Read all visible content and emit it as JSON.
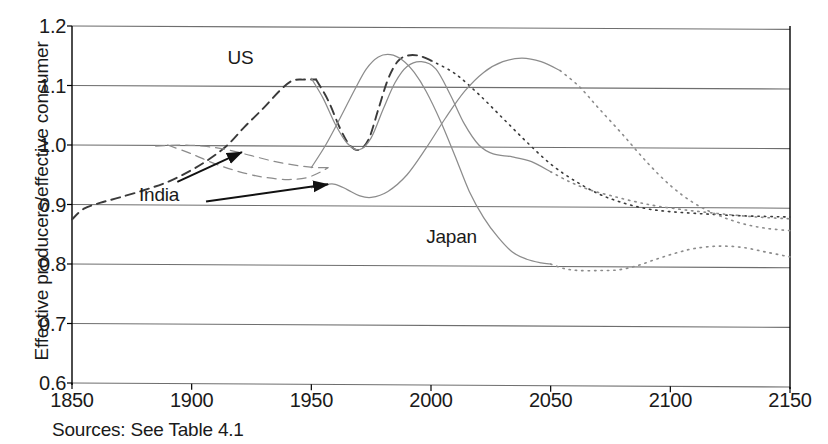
{
  "figure": {
    "source_note": "Sources:  See Table 4.1"
  },
  "chart_data": {
    "type": "line",
    "title": "",
    "xlabel": "",
    "ylabel": "Effective producers/effective consumer",
    "xlim": [
      1850,
      2150
    ],
    "ylim": [
      0.6,
      1.2
    ],
    "xticks": [
      1850,
      1900,
      1950,
      2000,
      2050,
      2100,
      2150
    ],
    "yticks": [
      "0.6",
      "0.7",
      "0.8",
      "0.9",
      "1.0",
      "1.1",
      "1.2"
    ],
    "grid": "horizontal",
    "legend": "inline-annotations",
    "annotations": [
      {
        "text": "US",
        "x": 1915,
        "y": 1.145
      },
      {
        "text": "India",
        "x": 1878,
        "y": 0.915
      },
      {
        "text": "Japan",
        "x": 1998,
        "y": 0.843
      }
    ],
    "arrows": [
      {
        "from": [
          1894,
          0.938
        ],
        "to": [
          1921,
          0.988
        ],
        "label": "India"
      },
      {
        "from": [
          1906,
          0.905
        ],
        "to": [
          1957,
          0.934
        ],
        "label": "India"
      }
    ],
    "series": [
      {
        "name": "US",
        "style": "dark",
        "segments": [
          {
            "style": "dashed",
            "kind": "historical",
            "points": [
              [
                1850,
                0.875
              ],
              [
                1855,
                0.893
              ],
              [
                1862,
                0.903
              ],
              [
                1870,
                0.912
              ],
              [
                1880,
                0.924
              ],
              [
                1890,
                0.938
              ],
              [
                1900,
                0.958
              ],
              [
                1908,
                0.978
              ],
              [
                1915,
                1.0
              ],
              [
                1922,
                1.03
              ],
              [
                1930,
                1.062
              ],
              [
                1937,
                1.092
              ],
              [
                1942,
                1.108
              ],
              [
                1947,
                1.11
              ],
              [
                1952,
                1.11
              ]
            ]
          },
          {
            "style": "dashed",
            "kind": "historical",
            "points": [
              [
                1952,
                1.11
              ],
              [
                1957,
                1.075
              ],
              [
                1962,
                1.028
              ],
              [
                1966,
                1.0
              ],
              [
                1970,
                0.992
              ],
              [
                1974,
                1.01
              ],
              [
                1978,
                1.06
              ],
              [
                1982,
                1.11
              ],
              [
                1986,
                1.14
              ],
              [
                1990,
                1.15
              ],
              [
                1995,
                1.15
              ],
              [
                2000,
                1.142
              ]
            ]
          },
          {
            "style": "dotted",
            "kind": "projection",
            "points": [
              [
                2000,
                1.142
              ],
              [
                2010,
                1.12
              ],
              [
                2020,
                1.085
              ],
              [
                2030,
                1.045
              ],
              [
                2040,
                1.005
              ],
              [
                2050,
                0.968
              ],
              [
                2060,
                0.94
              ],
              [
                2070,
                0.918
              ],
              [
                2080,
                0.903
              ],
              [
                2090,
                0.893
              ],
              [
                2100,
                0.888
              ],
              [
                2115,
                0.884
              ],
              [
                2130,
                0.881
              ],
              [
                2150,
                0.879
              ]
            ]
          }
        ]
      },
      {
        "name": "US-light",
        "style": "light",
        "segments": [
          {
            "style": "solid",
            "kind": "historical",
            "points": [
              [
                1950,
                1.112
              ],
              [
                1955,
                1.078
              ],
              [
                1960,
                1.035
              ],
              [
                1965,
                1.003
              ],
              [
                1970,
                0.992
              ],
              [
                1975,
                1.012
              ],
              [
                1980,
                1.06
              ],
              [
                1985,
                1.105
              ],
              [
                1990,
                1.132
              ],
              [
                1996,
                1.14
              ],
              [
                2002,
                1.128
              ],
              [
                2008,
                1.085
              ],
              [
                2014,
                1.035
              ],
              [
                2020,
                1.0
              ],
              [
                2026,
                0.985
              ],
              [
                2034,
                0.98
              ],
              [
                2042,
                0.972
              ],
              [
                2050,
                0.955
              ]
            ]
          },
          {
            "style": "dotted",
            "kind": "projection",
            "points": [
              [
                2050,
                0.955
              ],
              [
                2058,
                0.938
              ],
              [
                2066,
                0.925
              ],
              [
                2075,
                0.915
              ],
              [
                2085,
                0.905
              ],
              [
                2095,
                0.897
              ],
              [
                2108,
                0.89
              ],
              [
                2122,
                0.884
              ],
              [
                2136,
                0.879
              ],
              [
                2150,
                0.876
              ]
            ]
          }
        ]
      },
      {
        "name": "India",
        "style": "light",
        "segments": [
          {
            "style": "dashed",
            "kind": "historical",
            "points": [
              [
                1885,
                0.998
              ],
              [
                1895,
                1.0
              ],
              [
                1905,
                0.998
              ],
              [
                1915,
                0.992
              ],
              [
                1925,
                0.982
              ],
              [
                1935,
                0.972
              ],
              [
                1945,
                0.965
              ],
              [
                1952,
                0.962
              ],
              [
                1957,
                0.962
              ]
            ]
          },
          {
            "style": "dashed",
            "kind": "historical",
            "points": [
              [
                1890,
                1.0
              ],
              [
                1900,
                0.985
              ],
              [
                1910,
                0.968
              ],
              [
                1920,
                0.955
              ],
              [
                1930,
                0.946
              ],
              [
                1940,
                0.942
              ],
              [
                1948,
                0.945
              ],
              [
                1954,
                0.955
              ],
              [
                1957,
                0.962
              ]
            ]
          },
          {
            "style": "solid",
            "kind": "historical",
            "points": [
              [
                1950,
                0.928
              ],
              [
                1955,
                0.933
              ],
              [
                1960,
                0.934
              ],
              [
                1965,
                0.925
              ],
              [
                1970,
                0.915
              ],
              [
                1975,
                0.912
              ],
              [
                1982,
                0.922
              ],
              [
                1990,
                0.95
              ],
              [
                1998,
                0.995
              ],
              [
                2006,
                1.045
              ],
              [
                2014,
                1.09
              ],
              [
                2022,
                1.122
              ],
              [
                2030,
                1.14
              ],
              [
                2038,
                1.146
              ],
              [
                2046,
                1.14
              ],
              [
                2054,
                1.125
              ]
            ]
          },
          {
            "style": "dotted",
            "kind": "projection",
            "points": [
              [
                2054,
                1.125
              ],
              [
                2062,
                1.098
              ],
              [
                2070,
                1.062
              ],
              [
                2080,
                1.018
              ],
              [
                2090,
                0.972
              ],
              [
                2100,
                0.932
              ],
              [
                2110,
                0.902
              ],
              [
                2120,
                0.882
              ],
              [
                2130,
                0.868
              ],
              [
                2140,
                0.86
              ],
              [
                2150,
                0.856
              ]
            ]
          }
        ]
      },
      {
        "name": "Japan",
        "style": "light",
        "segments": [
          {
            "style": "solid",
            "kind": "historical",
            "points": [
              [
                1950,
                0.962
              ],
              [
                1956,
                1.0
              ],
              [
                1962,
                1.045
              ],
              [
                1968,
                1.092
              ],
              [
                1973,
                1.128
              ],
              [
                1978,
                1.148
              ],
              [
                1983,
                1.152
              ],
              [
                1988,
                1.143
              ],
              [
                1993,
                1.122
              ],
              [
                1998,
                1.09
              ],
              [
                2004,
                1.04
              ],
              [
                2010,
                0.982
              ],
              [
                2016,
                0.922
              ],
              [
                2022,
                0.878
              ],
              [
                2028,
                0.845
              ],
              [
                2034,
                0.82
              ],
              [
                2040,
                0.808
              ],
              [
                2046,
                0.802
              ],
              [
                2050,
                0.8
              ]
            ]
          },
          {
            "style": "dotted",
            "kind": "projection",
            "points": [
              [
                2050,
                0.8
              ],
              [
                2056,
                0.792
              ],
              [
                2062,
                0.789
              ],
              [
                2070,
                0.789
              ],
              [
                2078,
                0.79
              ],
              [
                2086,
                0.797
              ],
              [
                2094,
                0.808
              ],
              [
                2102,
                0.818
              ],
              [
                2110,
                0.826
              ],
              [
                2120,
                0.83
              ],
              [
                2130,
                0.828
              ],
              [
                2140,
                0.82
              ],
              [
                2150,
                0.812
              ]
            ]
          }
        ]
      }
    ],
    "colors": {
      "axis": "#000000",
      "grid": "#6e6e6e",
      "dark_series": "#3a3a3a",
      "light_series": "#8c8c8c",
      "text": "#1a1a1a"
    }
  }
}
